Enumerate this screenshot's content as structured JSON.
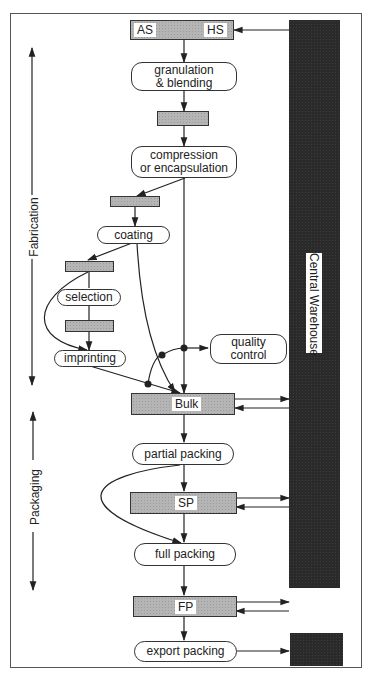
{
  "diagram": {
    "phases": {
      "fabrication": "Fabrication",
      "packaging": "Packaging"
    },
    "warehouse": {
      "label": "Central Warehouse",
      "color": "#2a2a2a"
    },
    "stock_points": {
      "raw": {
        "left": "AS",
        "right": "HS"
      },
      "bulk": "Bulk",
      "semi_packed": "SP",
      "finished": "FP"
    },
    "processes": {
      "granulation": "granulation\n& blending",
      "granulation_l1": "granulation",
      "granulation_l2": "& blending",
      "compression_l1": "compression",
      "compression_l2": "or encapsulation",
      "coating": "coating",
      "selection": "selection",
      "imprinting": "imprinting",
      "quality_l1": "quality",
      "quality_l2": "control",
      "partial_packing": "partial packing",
      "full_packing": "full packing",
      "export_packing": "export packing"
    },
    "colors": {
      "stock_fill": "#b5b5b5",
      "line": "#222222",
      "frame": "#555555"
    }
  }
}
